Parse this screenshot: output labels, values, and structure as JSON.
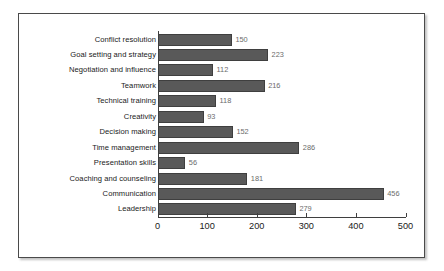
{
  "chart_data": {
    "type": "bar",
    "orientation": "horizontal",
    "title": "",
    "xlabel": "",
    "ylabel": "",
    "xlim": [
      0,
      500
    ],
    "xticks": [
      0,
      100,
      200,
      300,
      400,
      500
    ],
    "grid": false,
    "legend": false,
    "bar_color": "#595959",
    "value_label_color": "#6b6b6b",
    "categories": [
      "Conflict resolution",
      "Goal setting and strategy",
      "Negotiation and influence",
      "Teamwork",
      "Technical training",
      "Creativity",
      "Decision making",
      "Time management",
      "Presentation skills",
      "Coaching and counseling",
      "Communication",
      "Leadership"
    ],
    "values": [
      150,
      223,
      112,
      216,
      118,
      93,
      152,
      286,
      56,
      181,
      456,
      279
    ],
    "value_labels": [
      "150",
      "223",
      "112",
      "216",
      "118",
      "93",
      "152",
      "286",
      "56",
      "181",
      "456",
      "279"
    ],
    "xtick_labels": [
      "0",
      "100",
      "200",
      "300",
      "400",
      "500"
    ]
  }
}
